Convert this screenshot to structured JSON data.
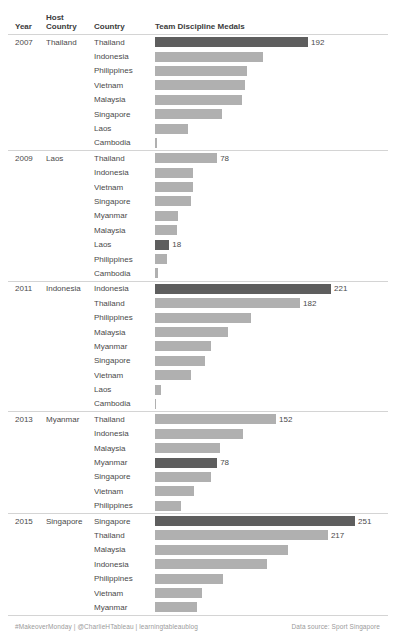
{
  "table": {
    "headers": {
      "year": "Year",
      "host_country": "Host Country",
      "country": "Country",
      "measure": "Team Discipline Medals"
    }
  },
  "footer": {
    "credit": "#MakeoverMonday | @CharlieHTableau | learningtableaublog",
    "source": "Data source: Sport Singapore"
  },
  "colors": {
    "host_bar": "#5e5e5e",
    "other_bar": "#b0b0b0",
    "text": "#4a4a4a",
    "rule": "#d4d4d4"
  },
  "chart_data": {
    "type": "bar",
    "title": "Team Discipline Medals",
    "xlabel": "Team Discipline Medals",
    "ylabel": "Country",
    "orientation": "horizontal",
    "grid": false,
    "legend": "none",
    "xlim": [
      0,
      251
    ],
    "label_rule": "value shown only for host-country bars and overall leaders",
    "groups": [
      {
        "year": "2007",
        "host_country": "Thailand",
        "rows": [
          {
            "country": "Thailand",
            "value": 192,
            "is_host": true,
            "label": "192"
          },
          {
            "country": "Indonesia",
            "value": 135,
            "is_host": false,
            "label": ""
          },
          {
            "country": "Philippines",
            "value": 115,
            "is_host": false,
            "label": ""
          },
          {
            "country": "Vietnam",
            "value": 113,
            "is_host": false,
            "label": ""
          },
          {
            "country": "Malaysia",
            "value": 109,
            "is_host": false,
            "label": ""
          },
          {
            "country": "Singapore",
            "value": 84,
            "is_host": false,
            "label": ""
          },
          {
            "country": "Laos",
            "value": 42,
            "is_host": false,
            "label": ""
          },
          {
            "country": "Cambodia",
            "value": 2,
            "is_host": false,
            "label": ""
          }
        ]
      },
      {
        "year": "2009",
        "host_country": "Laos",
        "rows": [
          {
            "country": "Thailand",
            "value": 78,
            "is_host": false,
            "label": "78"
          },
          {
            "country": "Indonesia",
            "value": 48,
            "is_host": false,
            "label": ""
          },
          {
            "country": "Vietnam",
            "value": 48,
            "is_host": false,
            "label": ""
          },
          {
            "country": "Singapore",
            "value": 45,
            "is_host": false,
            "label": ""
          },
          {
            "country": "Myanmar",
            "value": 29,
            "is_host": false,
            "label": ""
          },
          {
            "country": "Malaysia",
            "value": 27,
            "is_host": false,
            "label": ""
          },
          {
            "country": "Laos",
            "value": 18,
            "is_host": true,
            "label": "18"
          },
          {
            "country": "Philippines",
            "value": 15,
            "is_host": false,
            "label": ""
          },
          {
            "country": "Cambodia",
            "value": 4,
            "is_host": false,
            "label": ""
          }
        ]
      },
      {
        "year": "2011",
        "host_country": "Indonesia",
        "rows": [
          {
            "country": "Indonesia",
            "value": 221,
            "is_host": true,
            "label": "221"
          },
          {
            "country": "Thailand",
            "value": 182,
            "is_host": false,
            "label": "182"
          },
          {
            "country": "Philippines",
            "value": 120,
            "is_host": false,
            "label": ""
          },
          {
            "country": "Malaysia",
            "value": 91,
            "is_host": false,
            "label": ""
          },
          {
            "country": "Myanmar",
            "value": 70,
            "is_host": false,
            "label": ""
          },
          {
            "country": "Singapore",
            "value": 63,
            "is_host": false,
            "label": ""
          },
          {
            "country": "Vietnam",
            "value": 45,
            "is_host": false,
            "label": ""
          },
          {
            "country": "Laos",
            "value": 7,
            "is_host": false,
            "label": ""
          },
          {
            "country": "Cambodia",
            "value": 1,
            "is_host": false,
            "label": ""
          }
        ]
      },
      {
        "year": "2013",
        "host_country": "Myanmar",
        "rows": [
          {
            "country": "Thailand",
            "value": 152,
            "is_host": false,
            "label": "152"
          },
          {
            "country": "Indonesia",
            "value": 110,
            "is_host": false,
            "label": ""
          },
          {
            "country": "Malaysia",
            "value": 82,
            "is_host": false,
            "label": ""
          },
          {
            "country": "Myanmar",
            "value": 78,
            "is_host": true,
            "label": "78"
          },
          {
            "country": "Singapore",
            "value": 70,
            "is_host": false,
            "label": ""
          },
          {
            "country": "Vietnam",
            "value": 49,
            "is_host": false,
            "label": ""
          },
          {
            "country": "Philippines",
            "value": 33,
            "is_host": false,
            "label": ""
          }
        ]
      },
      {
        "year": "2015",
        "host_country": "Singapore",
        "rows": [
          {
            "country": "Singapore",
            "value": 251,
            "is_host": true,
            "label": "251"
          },
          {
            "country": "Thailand",
            "value": 217,
            "is_host": false,
            "label": "217"
          },
          {
            "country": "Malaysia",
            "value": 167,
            "is_host": false,
            "label": ""
          },
          {
            "country": "Indonesia",
            "value": 140,
            "is_host": false,
            "label": ""
          },
          {
            "country": "Philippines",
            "value": 85,
            "is_host": false,
            "label": ""
          },
          {
            "country": "Vietnam",
            "value": 59,
            "is_host": false,
            "label": ""
          },
          {
            "country": "Myanmar",
            "value": 53,
            "is_host": false,
            "label": ""
          }
        ]
      }
    ]
  }
}
